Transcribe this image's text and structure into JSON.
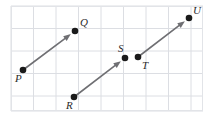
{
  "figure": {
    "type": "geometry-vector-diagram",
    "width": 209,
    "height": 119,
    "background_color": "#ffffff",
    "grid": {
      "visible": true,
      "line_color": "#dcdee3",
      "border_color": "#e2e4e8",
      "cell_size": 22.5,
      "origin_x": 11,
      "origin_y": 6,
      "columns": 8,
      "rows": 5,
      "plot_left": 11,
      "plot_top": 6,
      "plot_right": 203,
      "plot_bottom": 111
    },
    "stroke_color": "#6f6f73",
    "point_color": "#1a1a1a",
    "point_radius": 3.3,
    "arrow_stroke_width": 1.6
  },
  "points": [
    {
      "name": "P",
      "label": "P",
      "x": 23,
      "y": 70,
      "label_x": 15,
      "label_y": 73
    },
    {
      "name": "Q",
      "label": "Q",
      "x": 75,
      "y": 31,
      "label_x": 80,
      "label_y": 17
    },
    {
      "name": "R",
      "label": "R",
      "x": 74,
      "y": 97,
      "label_x": 66,
      "label_y": 100
    },
    {
      "name": "S",
      "label": "S",
      "x": 125,
      "y": 58,
      "label_x": 118,
      "label_y": 43
    },
    {
      "name": "T",
      "label": "T",
      "x": 138,
      "y": 57,
      "label_x": 142,
      "label_y": 60
    },
    {
      "name": "U",
      "label": "U",
      "x": 189,
      "y": 18,
      "label_x": 193,
      "label_y": 5
    }
  ],
  "vectors": [
    {
      "name": "vector-PQ",
      "label": "PQ",
      "from": "P",
      "to": "Q",
      "x1": 23,
      "y1": 70,
      "x2": 75,
      "y2": 31,
      "arrowhead_at": "Q"
    },
    {
      "name": "vector-RS",
      "label": "RS",
      "from": "R",
      "to": "S",
      "x1": 74,
      "y1": 97,
      "x2": 125,
      "y2": 58,
      "arrowhead_at": "S"
    },
    {
      "name": "vector-TU",
      "label": "TU",
      "from": "T",
      "to": "U",
      "x1": 138,
      "y1": 57,
      "x2": 189,
      "y2": 18,
      "arrowhead_at": "U"
    }
  ]
}
